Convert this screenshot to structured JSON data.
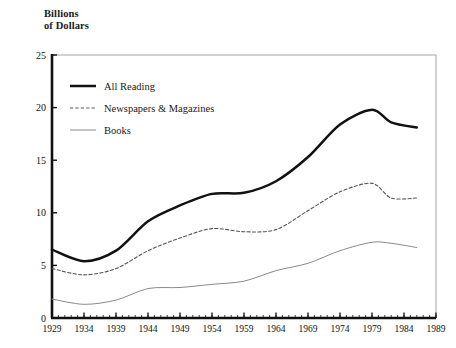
{
  "chart_data": {
    "type": "line",
    "title": "",
    "ylabel": "Billions\nof Dollars",
    "xlabel": "",
    "ylim": [
      0,
      25
    ],
    "xlim": [
      1929,
      1989
    ],
    "yticks": [
      0,
      5,
      10,
      15,
      20,
      25
    ],
    "xticks": [
      1929,
      1934,
      1939,
      1944,
      1949,
      1954,
      1959,
      1964,
      1969,
      1974,
      1979,
      1984,
      1989
    ],
    "minor_xtick_interval": 1,
    "grid": false,
    "legend_position": "upper-left-inside",
    "x": [
      1929,
      1934,
      1939,
      1944,
      1949,
      1954,
      1959,
      1964,
      1969,
      1974,
      1979,
      1982,
      1986
    ],
    "series": [
      {
        "name": "All Reading",
        "style": "solid-thick",
        "color": "#111111",
        "values": [
          6.5,
          5.4,
          6.4,
          9.2,
          10.7,
          11.8,
          11.9,
          13.0,
          15.3,
          18.4,
          19.8,
          18.6,
          18.1
        ]
      },
      {
        "name": "Newspapers & Magazines",
        "style": "dashed",
        "color": "#555555",
        "values": [
          4.7,
          4.1,
          4.7,
          6.4,
          7.6,
          8.5,
          8.2,
          8.4,
          10.2,
          12.0,
          12.8,
          11.4,
          11.4
        ]
      },
      {
        "name": "Books",
        "style": "solid-thin",
        "color": "#8a8a8a",
        "values": [
          1.8,
          1.3,
          1.7,
          2.8,
          2.9,
          3.2,
          3.5,
          4.5,
          5.2,
          6.4,
          7.2,
          7.1,
          6.7
        ]
      }
    ]
  },
  "legend": {
    "items": [
      {
        "label": "All Reading"
      },
      {
        "label": "Newspapers & Magazines"
      },
      {
        "label": "Books"
      }
    ]
  }
}
